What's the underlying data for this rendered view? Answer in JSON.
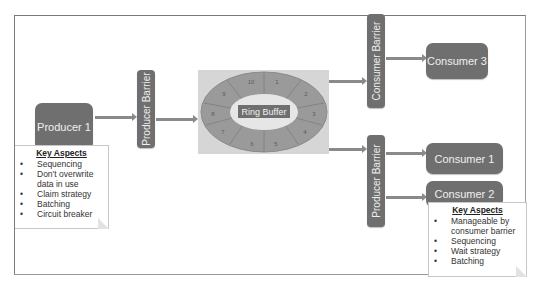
{
  "diagram": {
    "producer": {
      "label": "Producer 1"
    },
    "producer_barrier_left": {
      "label": "Producer Barrier"
    },
    "ring_buffer": {
      "label": "Ring Buffer",
      "slots": [
        "10",
        "1",
        "2",
        "3",
        "4",
        "5",
        "6",
        "7",
        "8",
        "9"
      ]
    },
    "consumer_barrier": {
      "label": "Consumer Barrier"
    },
    "producer_barrier_right": {
      "label": "Producer Barrier"
    },
    "consumers": [
      {
        "label": "Consumer 3"
      },
      {
        "label": "Consumer 1"
      },
      {
        "label": "Consumer 2"
      }
    ],
    "producer_notes": {
      "title": "Key Aspects",
      "items": [
        "Sequencing",
        "Don't overwrite data in use",
        "Claim strategy",
        "Batching",
        "Circuit breaker"
      ]
    },
    "consumer_notes": {
      "title": "Key Aspects",
      "items": [
        "Manageable by consumer barrier",
        "Sequencing",
        "Wait strategy",
        "Batching"
      ]
    }
  },
  "colors": {
    "box_fill": "#6f6f6f",
    "box_text": "#f0f0f0",
    "arrow": "#8a8a8a",
    "ring_outer": "#9a9a9a",
    "ring_inner": "#e6e6e6",
    "ring_bg": "#d6d6d6"
  }
}
